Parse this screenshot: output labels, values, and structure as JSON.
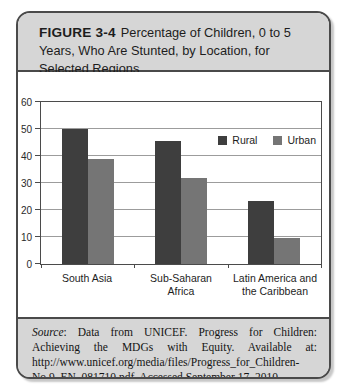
{
  "figure": {
    "label": "FIGURE 3-4",
    "title": "Percentage of Children, 0 to 5 Years, Who Are Stunted, by Location, for Selected Regions",
    "source": {
      "prefix": "Source",
      "text": ": Data from UNICEF. Progress for Children: Achieving the MDGs with Equity. Available at: http://www.unicef.org/media/files/Progress_for_Children-No.9_EN_081710.pdf. Accessed September 17, 2010."
    }
  },
  "colors": {
    "rural_bar": "#3e3e3e",
    "urban_bar": "#757575",
    "panel_bg": "#d6d6d6",
    "card_border": "#4a4a4a",
    "gridline": "#9c9c9c"
  },
  "chart_data": {
    "type": "bar",
    "title": "",
    "xlabel": "",
    "ylabel": "",
    "categories": [
      "South Asia",
      "Sub-Saharan Africa",
      "Latin America and the Caribbean"
    ],
    "series": [
      {
        "name": "Rural",
        "values": [
          50,
          45.5,
          23.5
        ],
        "color": "#3e3e3e"
      },
      {
        "name": "Urban",
        "values": [
          39,
          32,
          9.5
        ],
        "color": "#757575"
      }
    ],
    "ylim": [
      0,
      60
    ],
    "yticks": [
      0,
      10,
      20,
      30,
      40,
      50,
      60
    ],
    "grid": true,
    "legend_position": "top-right-inside"
  }
}
